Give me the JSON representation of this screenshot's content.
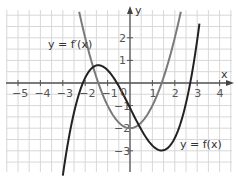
{
  "chart_data": {
    "type": "line",
    "title": "",
    "xlabel": "x",
    "ylabel": "y",
    "xlim": [
      -5.5,
      4.5
    ],
    "ylim": [
      -3.9,
      3.3
    ],
    "grid": true,
    "x_ticks": [
      "-5",
      "-4",
      "-3",
      "-2",
      "-1",
      "0",
      "1",
      "2",
      "3",
      "4"
    ],
    "y_ticks": [
      "-3",
      "-2",
      "-1",
      "1",
      "2"
    ],
    "series": [
      {
        "name": "y = f(x)",
        "color": "#222222",
        "formula": "x^3/3 - 2x - 1.1",
        "x_range": [
          -3.0,
          3.1
        ],
        "key_points": {
          "local_max": [
            -1.41,
            0.8
          ],
          "local_min": [
            1.41,
            -2.99
          ],
          "y_intercept": -1.1,
          "roots": [
            -2.1,
            -0.55,
            2.65
          ]
        }
      },
      {
        "name": "y = f'(x)",
        "color": "#7a7a7a",
        "formula": "x^2 - 2",
        "x_range": [
          -2.27,
          2.27
        ],
        "key_points": {
          "vertex": [
            0,
            -2
          ],
          "roots": [
            -1.41,
            1.41
          ]
        }
      }
    ],
    "annotations": [
      {
        "text": "y = f'(x)",
        "x": -3.4,
        "y": 1.65
      },
      {
        "text": "y = f(x)",
        "x": 2.3,
        "y": -2.7
      },
      {
        "text": "0",
        "x": -0.15,
        "y": -0.25
      }
    ]
  },
  "labels": {
    "f": "y = f(x)",
    "fprime": "y = f′(x)",
    "xaxis": "x",
    "yaxis": "y",
    "origin": "0"
  }
}
